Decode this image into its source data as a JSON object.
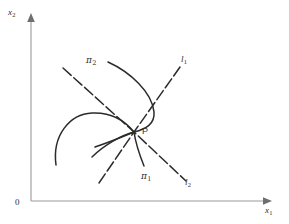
{
  "figure": {
    "background_color": "#ffffff",
    "curve_color": "#2b2b2b",
    "axis_color": "#9a9a9a",
    "axes": {
      "origin_label": "0",
      "x_axis": {
        "name": "x-axis",
        "label_base": "x",
        "label_sub": "1",
        "arrow": "right"
      },
      "y_axis": {
        "name": "y-axis",
        "label_base": "x",
        "label_sub": "2",
        "arrow": "up"
      }
    },
    "point": {
      "name": "equilibrium-point",
      "label": "P",
      "x": 134,
      "y": 132
    },
    "labels": [
      {
        "id": "pi2",
        "base": "π",
        "sub": "2",
        "x": 86,
        "y": 56,
        "style": "greek"
      },
      {
        "id": "pi1",
        "base": "π",
        "sub": "1",
        "x": 141,
        "y": 172,
        "style": "greek"
      },
      {
        "id": "l1",
        "base": "l",
        "sub": "1",
        "x": 181,
        "y": 55,
        "style": "italic"
      },
      {
        "id": "l2",
        "base": "l",
        "sub": "2",
        "x": 185,
        "y": 178,
        "style": "italic"
      }
    ],
    "curves": [
      {
        "id": "l1-line",
        "label": "l1",
        "kind": "dashed-straight",
        "description": "straight dashed line through P from lower-left to upper-right",
        "path": "M 99 183 L 134 132 L 180 67"
      },
      {
        "id": "l2-line",
        "label": "l2",
        "kind": "dashed-straight",
        "description": "straight dashed line through P from upper-left to lower-right",
        "path": "M 63 68 L 134 132 L 186 181"
      },
      {
        "id": "pi2-curve",
        "label": "pi2",
        "kind": "solid-curve",
        "description": "curve entering from upper area, bulging right, into P and continuing down-left",
        "path": "M 108 62 C 130 72 152 92 154 112 C 155 124 146 129 134 132 C 122 135 104 145 92 157"
      },
      {
        "id": "pi1-curve",
        "label": "pi1",
        "kind": "solid-curve",
        "description": "curve from P running down and slightly left",
        "path": "M 134 132 C 136 146 140 156 144 166"
      },
      {
        "id": "arc-curve",
        "label": "",
        "kind": "solid-curve",
        "description": "arc from lower-left rising and curving right into P",
        "path": "M 56 165 C 52 135 70 114 92 113 C 112 112 126 122 134 132"
      },
      {
        "id": "stub-curve",
        "label": "",
        "kind": "solid-curve",
        "description": "short curve from P down-left to a stub",
        "path": "M 134 132 C 122 137 110 142 95 147"
      }
    ]
  }
}
